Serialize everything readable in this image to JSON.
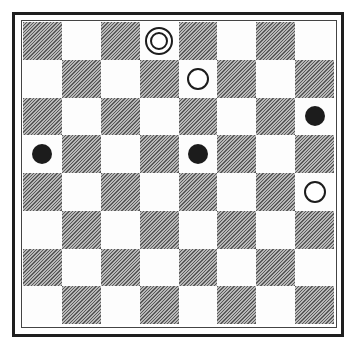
{
  "board": {
    "size": 8,
    "dark_square_parity": "even",
    "colors": {
      "dark": "#8a8a8a",
      "light": "#fdfdfd",
      "frame": "#1e1e1e",
      "piece_black": "#1c1c1c",
      "piece_white": "#ffffff"
    },
    "pieces": [
      {
        "row": 0,
        "col": 3,
        "color": "white",
        "type": "king"
      },
      {
        "row": 1,
        "col": 4,
        "color": "white",
        "type": "man"
      },
      {
        "row": 2,
        "col": 7,
        "color": "black",
        "type": "man"
      },
      {
        "row": 3,
        "col": 0,
        "color": "black",
        "type": "man"
      },
      {
        "row": 3,
        "col": 4,
        "color": "black",
        "type": "man"
      },
      {
        "row": 4,
        "col": 7,
        "color": "white",
        "type": "man"
      }
    ]
  }
}
